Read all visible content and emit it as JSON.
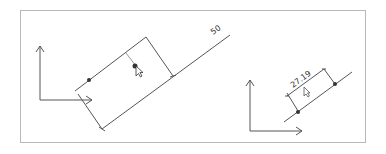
{
  "diagram": {
    "type": "dimension-illustration",
    "left_panel": {
      "dimension_label": "50",
      "description": "Aligned dimension being dragged with cursor"
    },
    "right_panel": {
      "dimension_label": "27.19",
      "description": "Aligned dimension between two points on a line"
    },
    "colors": {
      "line": "#555555",
      "frame": "#b8b8b8",
      "point": "#333333"
    }
  }
}
